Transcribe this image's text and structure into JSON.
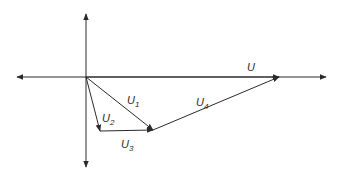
{
  "diagram": {
    "type": "phasor-diagram",
    "origin": [
      86,
      77
    ],
    "stroke_color": "#2a2a2a",
    "axes": {
      "horizontal": {
        "from": [
          17,
          77
        ],
        "to": [
          326,
          77
        ],
        "arrows": "both"
      },
      "vertical": {
        "from": [
          86,
          14
        ],
        "to": [
          86,
          167
        ],
        "arrows": "both"
      }
    },
    "vectors": [
      {
        "name": "U",
        "base": "U",
        "sub": "",
        "from": [
          86,
          77
        ],
        "to": [
          279,
          77
        ],
        "label_pos": [
          247,
          71
        ]
      },
      {
        "name": "U1",
        "base": "U",
        "sub": "1",
        "from": [
          86,
          77
        ],
        "to": [
          153,
          130
        ],
        "label_pos": [
          127,
          104
        ]
      },
      {
        "name": "U2",
        "base": "U",
        "sub": "2",
        "from": [
          86,
          77
        ],
        "to": [
          100,
          131
        ],
        "label_pos": [
          102,
          122
        ]
      },
      {
        "name": "U3",
        "base": "U",
        "sub": "3",
        "from": [
          100,
          131
        ],
        "to": [
          153,
          130
        ],
        "label_pos": [
          121,
          148
        ]
      },
      {
        "name": "U4",
        "base": "U",
        "sub": "4",
        "from": [
          153,
          130
        ],
        "to": [
          279,
          77
        ],
        "label_pos": [
          196,
          106
        ]
      }
    ]
  }
}
